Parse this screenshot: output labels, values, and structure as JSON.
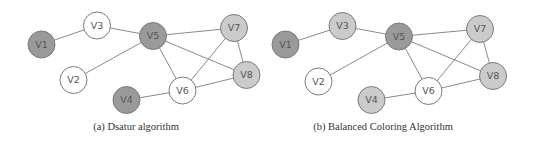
{
  "colors": {
    "dark": "#9a9a9a",
    "light": "#cbcbcb",
    "white": "#ffffff",
    "stroke": "#7a7a7a",
    "edge": "#8a8a8a"
  },
  "node_radius": 13.5,
  "edges": [
    [
      "V1",
      "V3"
    ],
    [
      "V3",
      "V5"
    ],
    [
      "V5",
      "V2"
    ],
    [
      "V5",
      "V7"
    ],
    [
      "V5",
      "V8"
    ],
    [
      "V5",
      "V6"
    ],
    [
      "V7",
      "V6"
    ],
    [
      "V7",
      "V8"
    ],
    [
      "V6",
      "V8"
    ],
    [
      "V6",
      "V4"
    ]
  ],
  "graphs": [
    {
      "id": "a",
      "caption": "(a) Dsatur algorithm",
      "caption_x": 136,
      "nodes": [
        {
          "id": "V1",
          "label": "V1",
          "x": 41.5,
          "y": 44.5,
          "color": "dark"
        },
        {
          "id": "V3",
          "label": "V3",
          "x": 97,
          "y": 25.5,
          "color": "white"
        },
        {
          "id": "V5",
          "label": "V5",
          "x": 153,
          "y": 36,
          "color": "dark"
        },
        {
          "id": "V7",
          "label": "V7",
          "x": 234,
          "y": 28,
          "color": "light"
        },
        {
          "id": "V2",
          "label": "V2",
          "x": 73.5,
          "y": 80,
          "color": "white"
        },
        {
          "id": "V8",
          "label": "V8",
          "x": 246.5,
          "y": 75,
          "color": "light"
        },
        {
          "id": "V6",
          "label": "V6",
          "x": 182.5,
          "y": 90.5,
          "color": "white"
        },
        {
          "id": "V4",
          "label": "V4",
          "x": 126.5,
          "y": 100,
          "color": "dark"
        }
      ]
    },
    {
      "id": "b",
      "caption": "(b) Balanced Coloring Algorithm",
      "caption_x": 383,
      "nodes": [
        {
          "id": "V1",
          "label": "V1",
          "x": 285.5,
          "y": 44.5,
          "color": "dark"
        },
        {
          "id": "V3",
          "label": "V3",
          "x": 342.5,
          "y": 26,
          "color": "light"
        },
        {
          "id": "V5",
          "label": "V5",
          "x": 399,
          "y": 36.5,
          "color": "dark"
        },
        {
          "id": "V7",
          "label": "V7",
          "x": 480,
          "y": 29,
          "color": "light"
        },
        {
          "id": "V2",
          "label": "V2",
          "x": 318.5,
          "y": 81.5,
          "color": "white"
        },
        {
          "id": "V8",
          "label": "V8",
          "x": 493,
          "y": 76,
          "color": "light"
        },
        {
          "id": "V6",
          "label": "V6",
          "x": 428.5,
          "y": 91,
          "color": "white"
        },
        {
          "id": "V4",
          "label": "V4",
          "x": 371.5,
          "y": 100,
          "color": "light"
        }
      ]
    }
  ]
}
